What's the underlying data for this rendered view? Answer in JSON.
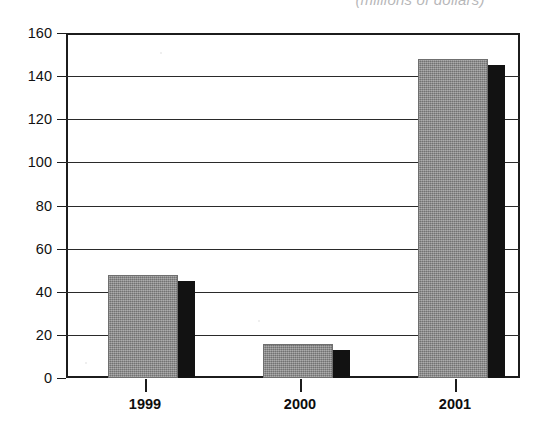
{
  "chart_data": {
    "type": "bar",
    "title": "(millions of dollars)",
    "title_truncated": true,
    "xlabel": "",
    "ylabel": "",
    "categories": [
      "1999",
      "2000",
      "2001"
    ],
    "values": [
      48,
      16,
      148
    ],
    "series": [
      {
        "name": "Amount",
        "values": [
          48,
          16,
          148
        ]
      }
    ],
    "ylim": [
      0,
      160
    ],
    "ytick_step": 20,
    "yticks": [
      "0",
      "20",
      "40",
      "60",
      "80",
      "100",
      "120",
      "140",
      "160"
    ],
    "grid": true,
    "grid_axis": "y",
    "legend": false,
    "legend_position": "none",
    "bar_color": "#8c8c8c",
    "bar_shadow_color": "#121212",
    "axis_color": "#1c1c1c",
    "background_color": "#ffffff"
  },
  "axis": {
    "y_labels": [
      "160",
      "140",
      "120",
      "100",
      "80",
      "60",
      "40",
      "20",
      "0"
    ],
    "x_labels": [
      "1999",
      "2000",
      "2001"
    ]
  }
}
